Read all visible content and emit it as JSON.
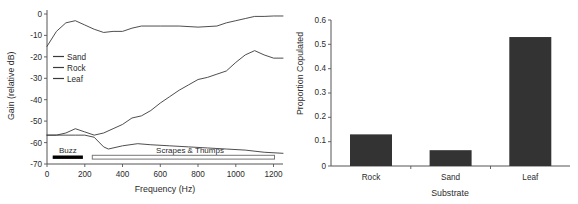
{
  "figure": {
    "panels": [
      "left-spectrum",
      "right-barchart"
    ]
  },
  "chart_data": [
    {
      "type": "line",
      "id": "substrate-transmission-spectrum",
      "title": "",
      "xlabel": "Frequency (Hz)",
      "ylabel": "Gain (relative dB)",
      "xlim": [
        0,
        1250
      ],
      "ylim": [
        -70,
        2
      ],
      "xticks": [
        0,
        200,
        400,
        600,
        800,
        1000,
        1200
      ],
      "yticks": [
        0,
        -10,
        -20,
        -30,
        -40,
        -50,
        -60,
        -70
      ],
      "grid": false,
      "legend_position": "upper-left-inside",
      "series": [
        {
          "name": "Sand",
          "color": "#3a3a3a",
          "x": [
            0,
            50,
            100,
            150,
            200,
            250,
            300,
            325,
            400,
            480,
            550,
            650,
            750,
            850,
            950,
            1050,
            1150,
            1250
          ],
          "y": [
            -56.5,
            -56.5,
            -56.5,
            -56.5,
            -56.5,
            -57.5,
            -62.0,
            -63.0,
            -61.5,
            -60.5,
            -61.0,
            -61.5,
            -62.0,
            -62.5,
            -63.0,
            -63.5,
            -64.5,
            -65.0
          ]
        },
        {
          "name": "Rock",
          "color": "#3a3a3a",
          "x": [
            0,
            50,
            100,
            150,
            200,
            250,
            300,
            350,
            400,
            450,
            500,
            550,
            600,
            650,
            700,
            750,
            800,
            850,
            900,
            950,
            1000,
            1050,
            1100,
            1150,
            1200,
            1250
          ],
          "y": [
            -56.5,
            -56.5,
            -55.5,
            -53.5,
            -55.0,
            -56.5,
            -55.5,
            -53.5,
            -51.5,
            -48.5,
            -47.5,
            -45.0,
            -41.5,
            -38.5,
            -35.5,
            -33.0,
            -30.5,
            -29.5,
            -28.0,
            -26.5,
            -22.5,
            -19.0,
            -17.0,
            -19.0,
            -20.5,
            -20.5
          ]
        },
        {
          "name": "Leaf",
          "color": "#3a3a3a",
          "x": [
            0,
            50,
            100,
            150,
            200,
            250,
            300,
            350,
            400,
            450,
            500,
            600,
            700,
            800,
            900,
            950,
            1000,
            1050,
            1100,
            1150,
            1200,
            1250
          ],
          "y": [
            -15.0,
            -8.0,
            -4.0,
            -3.0,
            -5.0,
            -7.0,
            -8.5,
            -8.0,
            -8.0,
            -6.5,
            -5.5,
            -5.5,
            -5.5,
            -6.0,
            -5.5,
            -4.0,
            -3.0,
            -2.0,
            -1.0,
            -1.0,
            -0.8,
            -0.8
          ]
        }
      ],
      "annotations": [
        {
          "label": "Buzz",
          "style": "filled-bar",
          "x_start": 30,
          "x_end": 190,
          "y": -68
        },
        {
          "label": "Scrapes & Thumps",
          "style": "open-bar",
          "x_start": 240,
          "x_end": 1205,
          "y": -68
        }
      ]
    },
    {
      "type": "bar",
      "id": "proportion-copulated-by-substrate",
      "title": "",
      "xlabel": "Substrate",
      "ylabel": "Proportion Copulated",
      "categories": [
        "Rock",
        "Sand",
        "Leaf"
      ],
      "values": [
        0.13,
        0.065,
        0.53
      ],
      "ylim": [
        0,
        0.6
      ],
      "yticks": [
        0,
        0.1,
        0.2,
        0.3,
        0.4,
        0.5,
        0.6
      ],
      "ytick_labels": [
        "0",
        "0.1",
        "0.2",
        "0.3",
        "0.4",
        "0.5",
        "0.6"
      ],
      "grid": false,
      "bar_color": "#333333"
    }
  ],
  "left_panel": {
    "ylabel": "Gain (relative dB)",
    "xlabel": "Frequency (Hz)",
    "ytick_labels": [
      "0",
      "-10",
      "-20",
      "-30",
      "-40",
      "-50",
      "-60",
      "-70"
    ],
    "xtick_labels": [
      "0",
      "200",
      "400",
      "600",
      "800",
      "1000",
      "1200"
    ],
    "legend": [
      {
        "label": "Sand"
      },
      {
        "label": "Rock"
      },
      {
        "label": "Leaf"
      }
    ],
    "annotations": {
      "buzz": "Buzz",
      "scrapes": "Scrapes & Thumps"
    }
  },
  "right_panel": {
    "ylabel": "Proportion Copulated",
    "xlabel": "Substrate",
    "ytick_labels": [
      "0.6",
      "0.5",
      "0.4",
      "0.3",
      "0.2",
      "0.1",
      "0"
    ],
    "xtick_labels": [
      "Rock",
      "Sand",
      "Leaf"
    ]
  }
}
